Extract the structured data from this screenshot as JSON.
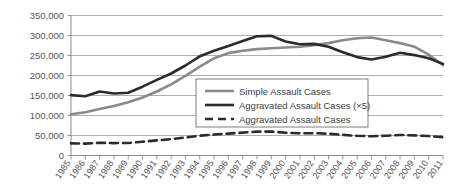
{
  "chart_data": {
    "type": "line",
    "title": "",
    "subtitle": "",
    "xlabel": "",
    "ylabel": "",
    "grid": "horizontal",
    "legend_position": "center-right-inside",
    "ylim": [
      0,
      350000
    ],
    "ytick_step": 50000,
    "ytick_labels": [
      "0",
      "50,000",
      "100,000",
      "150,000",
      "200,000",
      "250,000",
      "300,000",
      "350,000"
    ],
    "ytick_values": [
      0,
      50000,
      100000,
      150000,
      200000,
      250000,
      300000,
      350000
    ],
    "categories": [
      "1985",
      "1986",
      "1987",
      "1988",
      "1989",
      "1990",
      "1991",
      "1992",
      "1993",
      "1994",
      "1995",
      "1996",
      "1997",
      "1998",
      "1999",
      "2000",
      "2001",
      "2002",
      "2003",
      "2004",
      "2005",
      "2006",
      "2007",
      "2008",
      "2009",
      "2010",
      "2011"
    ],
    "x": [
      1985,
      1986,
      1987,
      1988,
      1989,
      1990,
      1991,
      1992,
      1993,
      1994,
      1995,
      1996,
      1997,
      1998,
      1999,
      2000,
      2001,
      2002,
      2003,
      2004,
      2005,
      2006,
      2007,
      2008,
      2009,
      2010,
      2011
    ],
    "series": [
      {
        "name": "Simple Assault Cases",
        "color": "#8a8a8a",
        "width": 2.6,
        "dash": "none",
        "values": [
          103000,
          108000,
          116000,
          124000,
          133000,
          145000,
          160000,
          178000,
          199000,
          222000,
          243000,
          256000,
          262000,
          266000,
          268000,
          270000,
          272000,
          276000,
          281000,
          288000,
          293000,
          295000,
          288000,
          281000,
          272000,
          252000,
          226000
        ]
      },
      {
        "name": "Aggravated Assault Cases (×5)",
        "color": "#2b2b2b",
        "width": 2.6,
        "dash": "none",
        "values": [
          151000,
          148000,
          160000,
          155000,
          157000,
          172000,
          189000,
          205000,
          225000,
          248000,
          262000,
          274000,
          286000,
          298000,
          299000,
          285000,
          278000,
          279000,
          272000,
          258000,
          246000,
          240000,
          247000,
          257000,
          251000,
          243000,
          229000
        ]
      },
      {
        "name": "Aggravated Assault Cases",
        "color": "#2b2b2b",
        "width": 2.6,
        "dash": "8,5",
        "values": [
          30200,
          29600,
          32000,
          31000,
          31400,
          34400,
          37800,
          41000,
          45000,
          49600,
          52400,
          54800,
          57200,
          59600,
          59800,
          57000,
          55600,
          55800,
          54400,
          51600,
          49200,
          48000,
          49400,
          51400,
          50200,
          48600,
          45800
        ]
      }
    ]
  },
  "legend": {
    "entries": [
      {
        "label": "Simple Assault Cases"
      },
      {
        "label": "Aggravated Assault Cases (×5)"
      },
      {
        "label": "Aggravated Assault Cases"
      }
    ]
  }
}
